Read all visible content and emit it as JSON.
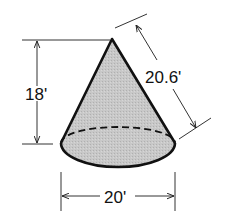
{
  "figure": {
    "shape": "right circular cone",
    "fill_color": "#c4c4c4",
    "stroke_color": "#111111"
  },
  "dimensions": {
    "height": {
      "label": "18'",
      "value": 18,
      "unit": "ft"
    },
    "slant_height": {
      "label": "20.6'",
      "value": 20.6,
      "unit": "ft"
    },
    "diameter": {
      "label": "20'",
      "value": 20,
      "unit": "ft"
    }
  }
}
